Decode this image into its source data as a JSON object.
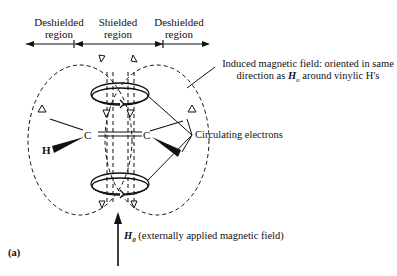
{
  "regions": {
    "left": {
      "line1": "Deshielded",
      "line2": "region"
    },
    "center": {
      "line1": "Shielded",
      "line2": "region"
    },
    "right": {
      "line1": "Deshielded",
      "line2": "region"
    }
  },
  "annotations": {
    "induced_line1": "Induced magnetic field: oriented in same",
    "induced_line2_pre": "direction as ",
    "induced_symbol": "H",
    "induced_sub": "o",
    "induced_line2_post": " around vinylic H's",
    "circulating": "Circulating electrons",
    "applied_symbol": "H",
    "applied_sub": "0",
    "applied_text": " (externally applied magnetic field)",
    "panel_label": "(a)"
  },
  "atoms": {
    "carbon_left": "C",
    "carbon_right": "C",
    "hydrogen": "H"
  }
}
